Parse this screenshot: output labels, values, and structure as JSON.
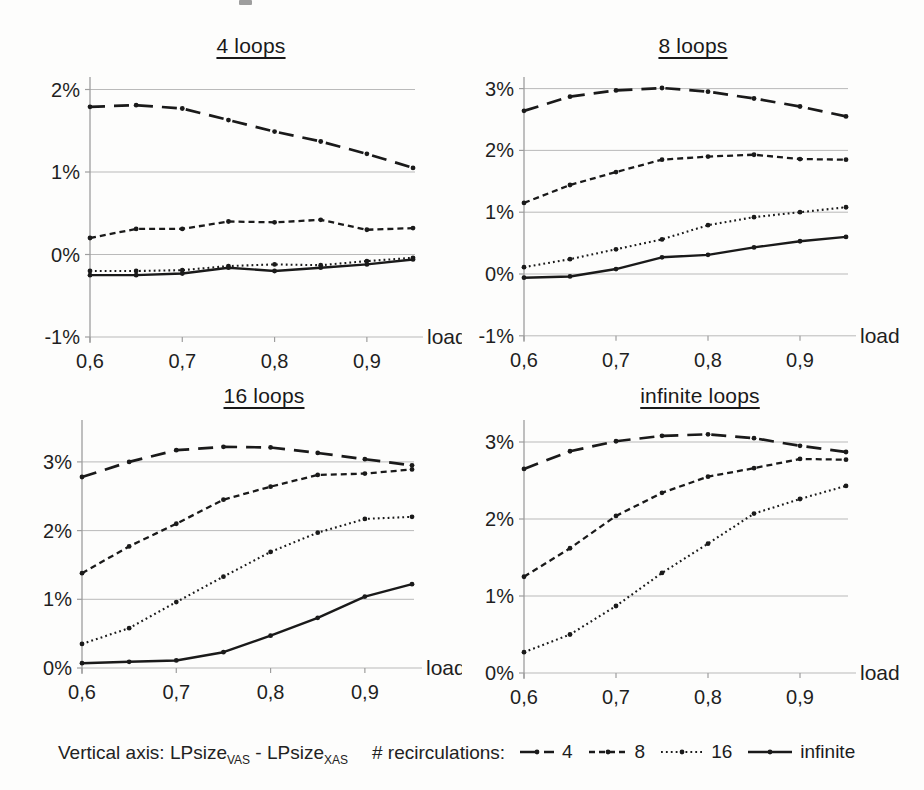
{
  "figure": {
    "caption": {
      "prefix": "Vertical axis: LPsize",
      "sub1": "VAS",
      "separator": " - LPsize",
      "sub2": "XAS"
    },
    "legend": {
      "label": "# recirculations:",
      "items": [
        {
          "label": "4",
          "style": "longdash"
        },
        {
          "label": "8",
          "style": "dash"
        },
        {
          "label": "16",
          "style": "dot"
        },
        {
          "label": "infinite",
          "style": "solid"
        }
      ]
    },
    "colors": {
      "line": "#1a1a1a",
      "grid": "#b3b3b3",
      "axis": "#9e9e9e",
      "text": "#1f1f1f"
    }
  },
  "chart_data": [
    {
      "type": "line",
      "title": "4 loops",
      "xlabel": "load",
      "x": [
        0.6,
        0.65,
        0.7,
        0.75,
        0.8,
        0.85,
        0.9,
        0.95
      ],
      "x_tick_values": [
        0.6,
        0.7,
        0.8,
        0.9
      ],
      "x_tick_labels": [
        "0,6",
        "0,7",
        "0,8",
        "0,9"
      ],
      "y_ticks": [
        {
          "value": -1,
          "label": "-1%"
        },
        {
          "value": 0,
          "label": "0%"
        },
        {
          "value": 1,
          "label": "1%"
        },
        {
          "value": 2,
          "label": "2%"
        }
      ],
      "ylim": [
        -1,
        2.15
      ],
      "series": [
        {
          "name": "4",
          "style": "longdash",
          "values": [
            1.79,
            1.81,
            1.77,
            1.63,
            1.49,
            1.37,
            1.22,
            1.05
          ]
        },
        {
          "name": "8",
          "style": "dash",
          "values": [
            0.2,
            0.31,
            0.31,
            0.4,
            0.39,
            0.42,
            0.3,
            0.32
          ]
        },
        {
          "name": "16",
          "style": "dot",
          "values": [
            -0.2,
            -0.2,
            -0.19,
            -0.14,
            -0.12,
            -0.13,
            -0.08,
            -0.04
          ]
        },
        {
          "name": "infinite",
          "style": "solid",
          "values": [
            -0.25,
            -0.25,
            -0.23,
            -0.16,
            -0.2,
            -0.16,
            -0.12,
            -0.06
          ]
        }
      ]
    },
    {
      "type": "line",
      "title": "8 loops",
      "xlabel": "load",
      "x": [
        0.6,
        0.65,
        0.7,
        0.75,
        0.8,
        0.85,
        0.9,
        0.95
      ],
      "x_tick_values": [
        0.6,
        0.7,
        0.8,
        0.9
      ],
      "x_tick_labels": [
        "0,6",
        "0,7",
        "0,8",
        "0,9"
      ],
      "y_ticks": [
        {
          "value": -1,
          "label": "-1%"
        },
        {
          "value": 0,
          "label": "0%"
        },
        {
          "value": 1,
          "label": "1%"
        },
        {
          "value": 2,
          "label": "2%"
        },
        {
          "value": 3,
          "label": "3%"
        }
      ],
      "ylim": [
        -1,
        3.19
      ],
      "series": [
        {
          "name": "4",
          "style": "longdash",
          "values": [
            2.64,
            2.87,
            2.97,
            3.01,
            2.95,
            2.84,
            2.71,
            2.55
          ]
        },
        {
          "name": "8",
          "style": "dash",
          "values": [
            1.15,
            1.44,
            1.65,
            1.85,
            1.9,
            1.93,
            1.86,
            1.85
          ]
        },
        {
          "name": "16",
          "style": "dot",
          "values": [
            0.11,
            0.24,
            0.4,
            0.56,
            0.79,
            0.92,
            1.0,
            1.08
          ]
        },
        {
          "name": "infinite",
          "style": "solid",
          "values": [
            -0.06,
            -0.04,
            0.08,
            0.27,
            0.31,
            0.43,
            0.53,
            0.6
          ]
        }
      ]
    },
    {
      "type": "line",
      "title": "16 loops",
      "xlabel": "load",
      "x": [
        0.6,
        0.65,
        0.7,
        0.75,
        0.8,
        0.85,
        0.9,
        0.95
      ],
      "x_tick_values": [
        0.6,
        0.7,
        0.8,
        0.9
      ],
      "x_tick_labels": [
        "0,6",
        "0,7",
        "0,8",
        "0,9"
      ],
      "y_ticks": [
        {
          "value": 0,
          "label": "0%"
        },
        {
          "value": 1,
          "label": "1%"
        },
        {
          "value": 2,
          "label": "2%"
        },
        {
          "value": 3,
          "label": "3%"
        }
      ],
      "ylim": [
        0,
        3.61
      ],
      "series": [
        {
          "name": "4",
          "style": "longdash",
          "values": [
            2.78,
            3.0,
            3.17,
            3.22,
            3.21,
            3.13,
            3.04,
            2.95
          ]
        },
        {
          "name": "8",
          "style": "dash",
          "values": [
            1.38,
            1.77,
            2.1,
            2.45,
            2.64,
            2.81,
            2.83,
            2.89
          ]
        },
        {
          "name": "16",
          "style": "dot",
          "values": [
            0.35,
            0.58,
            0.96,
            1.33,
            1.69,
            1.97,
            2.17,
            2.2
          ]
        },
        {
          "name": "infinite",
          "style": "solid",
          "values": [
            0.07,
            0.09,
            0.11,
            0.23,
            0.47,
            0.73,
            1.04,
            1.22
          ]
        }
      ]
    },
    {
      "type": "line",
      "title": "infinite loops",
      "xlabel": "load",
      "x": [
        0.6,
        0.65,
        0.7,
        0.75,
        0.8,
        0.85,
        0.9,
        0.95
      ],
      "x_tick_values": [
        0.6,
        0.7,
        0.8,
        0.9
      ],
      "x_tick_labels": [
        "0,6",
        "0,7",
        "0,8",
        "0,9"
      ],
      "y_ticks": [
        {
          "value": 0,
          "label": "0%"
        },
        {
          "value": 1,
          "label": "1%"
        },
        {
          "value": 2,
          "label": "2%"
        },
        {
          "value": 3,
          "label": "3%"
        }
      ],
      "ylim": [
        0,
        3.29
      ],
      "series": [
        {
          "name": "4",
          "style": "longdash",
          "values": [
            2.65,
            2.88,
            3.01,
            3.08,
            3.1,
            3.05,
            2.95,
            2.87
          ]
        },
        {
          "name": "8",
          "style": "dash",
          "values": [
            1.25,
            1.62,
            2.04,
            2.34,
            2.55,
            2.66,
            2.78,
            2.77
          ]
        },
        {
          "name": "16",
          "style": "dot",
          "values": [
            0.27,
            0.5,
            0.87,
            1.3,
            1.68,
            2.07,
            2.26,
            2.43
          ]
        }
      ]
    }
  ]
}
